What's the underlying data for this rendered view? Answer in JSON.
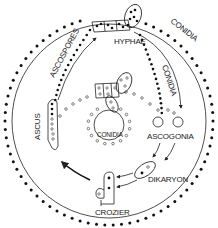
{
  "diagram": {
    "labels": {
      "hyphae": "HYPHAE",
      "conidia_outer": "CONIDIA",
      "conidia_inner": "CONIDIA",
      "conidia_center": "CONIDIA",
      "ascospores": "ASCOSPORES",
      "ascus": "ASCUS",
      "ascogonia": "ASCOGONIA",
      "dikaryon": "DIKARYON",
      "crozier": "CROZIER"
    },
    "stages": [
      "HYPHAE",
      "CONIDIA",
      "ASCOGONIA",
      "DIKARYON",
      "CROZIER",
      "ASCUS",
      "ASCOSPORES"
    ],
    "colors": {
      "line": "#222222",
      "filled_nucleus": "#111111",
      "background": "#ffffff"
    }
  }
}
